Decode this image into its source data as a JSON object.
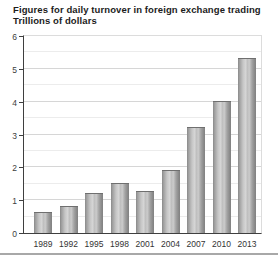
{
  "header": {
    "title": "Figures for daily turnover in foreign exchange trading",
    "subtitle": "Trillions of dollars"
  },
  "chart_data": {
    "type": "bar",
    "title": "Figures for daily turnover in foreign exchange trading",
    "subtitle": "Trillions of dollars",
    "categories": [
      "1989",
      "1992",
      "1995",
      "1998",
      "2001",
      "2004",
      "2007",
      "2010",
      "2013"
    ],
    "values": [
      0.6,
      0.8,
      1.2,
      1.5,
      1.25,
      1.9,
      3.2,
      4.0,
      5.3
    ],
    "xlabel": "",
    "ylabel": "Trillions of dollars",
    "ylim": [
      0,
      6
    ],
    "yticks": [
      "0",
      "1",
      "2",
      "3",
      "4",
      "5",
      "6"
    ],
    "grid": "horizontal major at 1.0, minor at 0.5",
    "legend": "none"
  },
  "colors": {
    "background": "#ffffff",
    "title_text": "#1c1c1c",
    "axis_line": "#3f3f3f",
    "tick_label": "#3d3d3d",
    "gridline_major": "#d6d6d6",
    "gridline_minor": "#ececec",
    "plot_border": "#dcdcdc",
    "bar_edge": "#898989",
    "bar_center": "#d5d5d5",
    "divider": "#a8a8a8"
  }
}
